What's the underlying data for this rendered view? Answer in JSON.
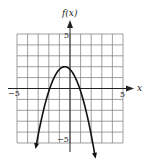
{
  "chart_data": {
    "type": "line",
    "title": "",
    "xlabel": "x",
    "ylabel": "f(x)",
    "xlim": [
      -5,
      5
    ],
    "ylim": [
      -5,
      5
    ],
    "grid": true,
    "tick_labels": {
      "x": [
        "-5",
        "5"
      ],
      "y": [
        "5",
        "-5"
      ]
    },
    "series": [
      {
        "name": "f(x) = -(x + 0.5)^2 + 2",
        "vertex": [
          -0.5,
          2
        ],
        "x_intercepts": [
          -1.9,
          0.9
        ],
        "x": [
          -3.2,
          -3,
          -2.5,
          -2,
          -1.5,
          -1,
          -0.5,
          0,
          0.5,
          1,
          1.5,
          2,
          2.36
        ],
        "y": [
          -5.3,
          -4.25,
          -2,
          -0.25,
          1,
          1.75,
          2,
          1.75,
          1,
          -0.25,
          -2,
          -4.25,
          -6.2
        ],
        "arrows_at_ends": true
      }
    ]
  },
  "labels": {
    "y_axis": "f(x)",
    "x_axis": "x",
    "x_min": "−5",
    "x_max": "5",
    "y_max": "5",
    "y_min": "−5"
  }
}
